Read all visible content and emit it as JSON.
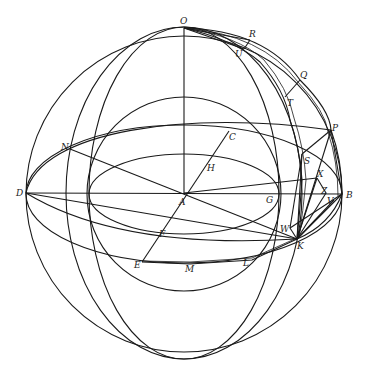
{
  "figure": {
    "type": "spherical geometry diagram",
    "stroke_color": "#1a1a1a",
    "background": "#ffffff"
  },
  "points": [
    {
      "id": "O",
      "label": "O",
      "x": 184,
      "y": 28,
      "lx": 180,
      "ly": 24
    },
    {
      "id": "R",
      "label": "R",
      "x": 250,
      "y": 40,
      "lx": 249,
      "ly": 37
    },
    {
      "id": "U",
      "label": "U",
      "x": 244,
      "y": 49,
      "lx": 235,
      "ly": 57
    },
    {
      "id": "Q",
      "label": "Q",
      "x": 300,
      "y": 80,
      "lx": 300,
      "ly": 78
    },
    {
      "id": "T",
      "label": "T",
      "x": 285,
      "y": 97,
      "lx": 287,
      "ly": 106
    },
    {
      "id": "P",
      "label": "P",
      "x": 331,
      "y": 130,
      "lx": 332,
      "ly": 131
    },
    {
      "id": "C",
      "label": "C",
      "x": 229,
      "y": 131,
      "lx": 229,
      "ly": 140
    },
    {
      "id": "N",
      "label": "N",
      "x": 70,
      "y": 149,
      "lx": 61,
      "ly": 150
    },
    {
      "id": "S",
      "label": "S",
      "x": 302,
      "y": 154,
      "lx": 304,
      "ly": 164
    },
    {
      "id": "H",
      "label": "H",
      "x": 208,
      "y": 162,
      "lx": 207,
      "ly": 171
    },
    {
      "id": "X",
      "label": "X",
      "x": 317,
      "y": 178,
      "lx": 317,
      "ly": 177
    },
    {
      "id": "D",
      "label": "D",
      "x": 26,
      "y": 193,
      "lx": 16,
      "ly": 196
    },
    {
      "id": "A",
      "label": "A",
      "x": 184,
      "y": 193,
      "lx": 179,
      "ly": 205
    },
    {
      "id": "Z",
      "label": "Z",
      "x": 326,
      "y": 193,
      "lx": 321,
      "ly": 194
    },
    {
      "id": "G",
      "label": "G",
      "x": 278,
      "y": 193,
      "lx": 266,
      "ly": 203
    },
    {
      "id": "B",
      "label": "B",
      "x": 342,
      "y": 194,
      "lx": 346,
      "ly": 198
    },
    {
      "id": "V",
      "label": "V",
      "x": 334,
      "y": 200,
      "lx": 327,
      "ly": 204
    },
    {
      "id": "F",
      "label": "F",
      "x": 164,
      "y": 227,
      "lx": 159,
      "ly": 237
    },
    {
      "id": "W",
      "label": "W",
      "x": 290,
      "y": 228,
      "lx": 280,
      "ly": 232
    },
    {
      "id": "K",
      "label": "K",
      "x": 297,
      "y": 239,
      "lx": 297,
      "ly": 249
    },
    {
      "id": "E",
      "label": "E",
      "x": 142,
      "y": 262,
      "lx": 134,
      "ly": 268
    },
    {
      "id": "L",
      "label": "L",
      "x": 252,
      "y": 260,
      "lx": 243,
      "ly": 266
    },
    {
      "id": "M",
      "label": "M",
      "x": 190,
      "y": 264,
      "lx": 185,
      "ly": 272
    }
  ]
}
